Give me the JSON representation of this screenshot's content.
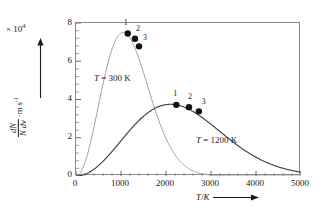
{
  "chart_data": {
    "type": "line",
    "title": "",
    "xlabel": "T/K",
    "ylabel_numerator": "dN",
    "ylabel_denominator": "N dv",
    "ylabel_units": "m s",
    "ylabel_units_exp": "-1",
    "y_exponent_prefix": "× 10",
    "y_exponent_power": "4",
    "xlim": [
      0,
      5000
    ],
    "ylim": [
      0,
      8
    ],
    "x_major_ticks": [
      0,
      1000,
      2000,
      3000,
      4000,
      5000
    ],
    "x_tick_labels": [
      "0",
      "1000",
      "2000",
      "3000",
      "4000",
      "5000"
    ],
    "x_minor_interval": 200,
    "y_major_ticks": [
      0,
      2,
      4,
      6,
      8
    ],
    "y_tick_labels": [
      "0",
      "2",
      "4",
      "6",
      "8"
    ],
    "y_minor_interval": 0.4,
    "grid": false,
    "legend_position": "inline-annotations",
    "series": [
      {
        "name": "T = 300 K",
        "label": "T = 300 K",
        "temperature_K": 300,
        "color": "#9a9a9a",
        "peak_x": 1050,
        "peak_y": 7.5,
        "points": [
          {
            "label": "1",
            "x": 1150,
            "y": 7.45
          },
          {
            "label": "2",
            "x": 1310,
            "y": 7.18
          },
          {
            "label": "3",
            "x": 1400,
            "y": 6.78
          }
        ]
      },
      {
        "name": "T = 1200 K",
        "label": "T = 1200 K",
        "temperature_K": 1200,
        "color": "#404040",
        "peak_x": 2100,
        "peak_y": 3.75,
        "points": [
          {
            "label": "1",
            "x": 2230,
            "y": 3.72
          },
          {
            "label": "2",
            "x": 2510,
            "y": 3.6
          },
          {
            "label": "3",
            "x": 2730,
            "y": 3.38
          }
        ]
      }
    ]
  },
  "axes": {
    "x_title": "T/K",
    "y_exponent": "× 10",
    "y_exponent_sup": "4"
  },
  "icons": {
    "y_axis_arrow": "up-arrow-icon",
    "x_axis_arrow": "right-arrow-icon"
  }
}
